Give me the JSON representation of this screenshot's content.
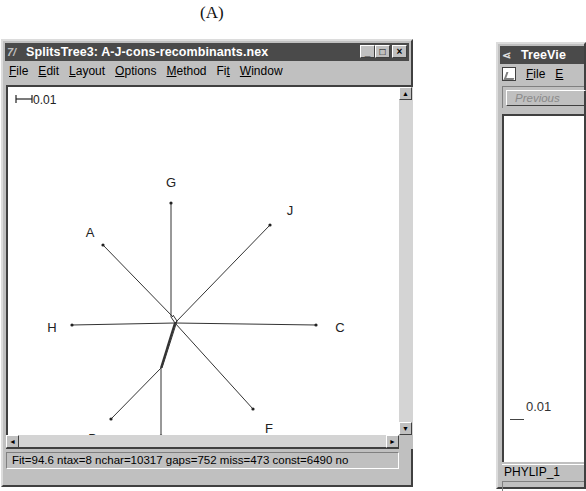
{
  "figure_label": "(A)",
  "splitstree": {
    "app_icon": "7/",
    "title": "SplitsTree3: A-J-cons-recombinants.nex",
    "window_buttons": {
      "minimize": "_",
      "maximize": "□",
      "close": "×"
    },
    "menu": [
      {
        "label": "File",
        "mnemonic": "F",
        "rest": "ile"
      },
      {
        "label": "Edit",
        "mnemonic": "E",
        "rest": "dit"
      },
      {
        "label": "Layout",
        "mnemonic": "L",
        "rest": "ayout"
      },
      {
        "label": "Options",
        "mnemonic": "O",
        "rest": "ptions"
      },
      {
        "label": "Method",
        "mnemonic": "M",
        "rest": "ethod"
      },
      {
        "label": "Fit",
        "mnemonic": "Fi",
        "rest": "t"
      },
      {
        "label": "Window",
        "mnemonic": "W",
        "rest": "indow"
      }
    ],
    "scale_bar_label": "0.01",
    "network": {
      "center": [
        167,
        236
      ],
      "taxa": [
        {
          "label": "G",
          "end": [
            163,
            116
          ],
          "label_pos": [
            163,
            100
          ]
        },
        {
          "label": "A",
          "end": [
            95,
            158
          ],
          "label_pos": [
            82,
            150
          ]
        },
        {
          "label": "J",
          "end": [
            262,
            138
          ],
          "label_pos": [
            282,
            128
          ]
        },
        {
          "label": "H",
          "end": [
            64,
            238
          ],
          "label_pos": [
            44,
            245
          ]
        },
        {
          "label": "C",
          "end": [
            308,
            238
          ],
          "label_pos": [
            332,
            245
          ]
        },
        {
          "label": "D",
          "end": [
            103,
            332
          ],
          "label_pos": [
            85,
            356
          ]
        },
        {
          "label": "B",
          "end": [
            153,
            349
          ],
          "label_pos": [
            152,
            376
          ]
        },
        {
          "label": "F",
          "end": [
            245,
            322
          ],
          "label_pos": [
            261,
            346
          ]
        }
      ],
      "internal_db": [
        153,
        281
      ]
    },
    "scroll": {
      "up": "▲",
      "down": "▼",
      "left": "◄",
      "right": "►"
    },
    "status": "Fit=94.6 ntax=8 nchar=10317 gaps=752 miss=473 const=6490 no"
  },
  "treeview": {
    "title": "TreeVie",
    "menu": [
      {
        "label": "File",
        "mnemonic": "F",
        "rest": "ile"
      },
      {
        "label": "E",
        "mnemonic": "E",
        "rest": ""
      }
    ],
    "previous_button": "Previous",
    "scale_label": "0.01",
    "tab_label": "PHYLIP_1"
  }
}
